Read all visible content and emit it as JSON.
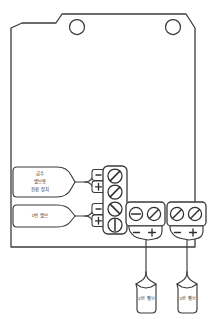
{
  "diagram": {
    "device": {
      "name": "controller-board",
      "mounting_holes": 2
    },
    "callouts": [
      {
        "id": "water-supply-valve-controller",
        "lines": [
          "급수",
          "밸브용",
          "전환 장치"
        ],
        "position": "left-upper"
      },
      {
        "id": "valve-1",
        "lines": [
          "1번 밸브"
        ],
        "position": "left-lower"
      },
      {
        "id": "valve-2",
        "lines": [
          "2번 밸브"
        ],
        "position": "bottom-left"
      },
      {
        "id": "valve-3",
        "lines": [
          "3번 밸브"
        ],
        "position": "bottom-right"
      }
    ],
    "terminal_blocks": [
      {
        "id": "vertical-terminal-strip",
        "orientation": "vertical",
        "screw_count": 4
      },
      {
        "id": "horizontal-terminal-block-left",
        "orientation": "horizontal",
        "screw_count": 2,
        "polarity": [
          "−",
          "+"
        ]
      },
      {
        "id": "horizontal-terminal-block-right",
        "orientation": "horizontal",
        "screw_count": 2,
        "polarity": [
          "−",
          "+"
        ]
      }
    ],
    "polarity_markers": {
      "minus": "−",
      "plus": "+"
    },
    "colors": {
      "ink": "#3a3a3c",
      "background": "#ffffff"
    }
  }
}
